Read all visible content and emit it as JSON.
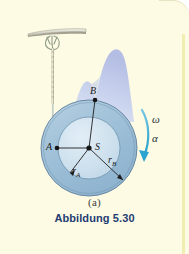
{
  "figure": {
    "sub_label": "(a)",
    "caption": "Abbildung 5.30",
    "caption_color": "#1f3d73",
    "background_color": "#fdfbe3",
    "points": [
      {
        "id": "A",
        "label": "A",
        "x": 57,
        "y": 148,
        "role": "point-on-inner-radius"
      },
      {
        "id": "B",
        "label": "B",
        "x": 95,
        "y": 100,
        "role": "point-on-outer-radius"
      },
      {
        "id": "S",
        "label": "S",
        "x": 89,
        "y": 148,
        "role": "center-of-mass"
      }
    ],
    "dimensions": [
      {
        "id": "rA",
        "base": "r",
        "subscript": "A",
        "label": "r",
        "meaning": "inner-radius"
      },
      {
        "id": "rB",
        "base": "r",
        "subscript": "B",
        "label": "r",
        "meaning": "outer-radius"
      }
    ],
    "kinematics": [
      {
        "id": "omega",
        "symbol": "ω",
        "meaning": "angular-velocity"
      },
      {
        "id": "alpha",
        "symbol": "α",
        "meaning": "angular-acceleration"
      }
    ],
    "elements": {
      "ceiling_plate": "ceiling-support-plate",
      "hook": "suspension-hook",
      "chain": "suspension-chain",
      "wheel_outer": "outer-disc",
      "wheel_inner": "inner-hub",
      "backdrop": "mountain-backdrop"
    },
    "colors": {
      "outer_disc": "#9fc1d8",
      "inner_hub": "#cfe1ee",
      "backdrop": "#c3cfee",
      "arrow": "#37a8d4",
      "plate": "#d9d8cc"
    }
  }
}
